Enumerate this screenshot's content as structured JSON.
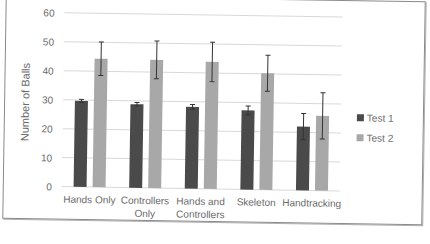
{
  "chart_data": {
    "type": "bar",
    "title": "",
    "xlabel": "",
    "ylabel": "Number of Balls",
    "ylim": [
      0,
      60
    ],
    "yticks": [
      0,
      10,
      20,
      30,
      40,
      50,
      60
    ],
    "grid": true,
    "legend_position": "right",
    "categories": [
      "Hands Only",
      "Controllers Only",
      "Hands and Controllers",
      "Skeleton",
      "Handtracking"
    ],
    "category_lines": [
      [
        "Hands Only"
      ],
      [
        "Controllers",
        "Only"
      ],
      [
        "Hands and",
        "Controllers"
      ],
      [
        "Skeleton"
      ],
      [
        "Handtracking"
      ]
    ],
    "series": [
      {
        "name": "Test 1",
        "color": "#4a4a4a",
        "values": [
          29.7,
          28.8,
          28.2,
          27.3,
          22.0
        ],
        "error": [
          0.5,
          0.6,
          0.8,
          1.5,
          4.5
        ]
      },
      {
        "name": "Test 2",
        "color": "#a8a8a8",
        "values": [
          44.3,
          44.2,
          43.8,
          40.2,
          25.8
        ],
        "error": [
          5.8,
          6.5,
          6.8,
          6.2,
          8.0
        ]
      }
    ]
  },
  "legend": {
    "items": [
      "Test 1",
      "Test 2"
    ]
  },
  "colors": {
    "test1": "#4a4a4a",
    "test2": "#a8a8a8",
    "grid": "#d9d9d9",
    "axis_text": "#6a6a6a"
  }
}
